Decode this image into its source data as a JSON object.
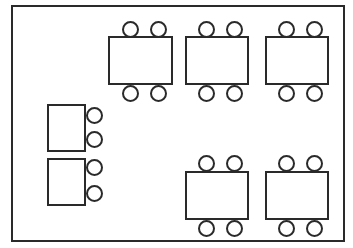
{
  "diagram": {
    "type": "floor-plan",
    "colors": {
      "stroke": "#2a2a2a",
      "fill": "#ffffff"
    },
    "room": {
      "x": 11,
      "y": 5,
      "w": 334,
      "h": 237
    },
    "tables": [
      {
        "id": "table-1",
        "x": 108,
        "y": 36,
        "w": 65,
        "h": 49,
        "chairs": [
          [
            130,
            29
          ],
          [
            158,
            29
          ],
          [
            130,
            93
          ],
          [
            158,
            93
          ]
        ]
      },
      {
        "id": "table-2",
        "x": 185,
        "y": 36,
        "w": 64,
        "h": 49,
        "chairs": [
          [
            206,
            29
          ],
          [
            234,
            29
          ],
          [
            206,
            93
          ],
          [
            234,
            93
          ]
        ]
      },
      {
        "id": "table-3",
        "x": 265,
        "y": 36,
        "w": 64,
        "h": 49,
        "chairs": [
          [
            286,
            29
          ],
          [
            314,
            29
          ],
          [
            286,
            93
          ],
          [
            314,
            93
          ]
        ]
      },
      {
        "id": "table-4",
        "x": 47,
        "y": 104,
        "w": 39,
        "h": 48,
        "chairs": [
          [
            94,
            115
          ],
          [
            94,
            139
          ]
        ]
      },
      {
        "id": "table-5",
        "x": 47,
        "y": 158,
        "w": 39,
        "h": 48,
        "chairs": [
          [
            94,
            167
          ],
          [
            94,
            193
          ]
        ]
      },
      {
        "id": "table-6",
        "x": 185,
        "y": 171,
        "w": 64,
        "h": 49,
        "chairs": [
          [
            206,
            163
          ],
          [
            234,
            163
          ],
          [
            206,
            228
          ],
          [
            234,
            228
          ]
        ]
      },
      {
        "id": "table-7",
        "x": 265,
        "y": 171,
        "w": 64,
        "h": 49,
        "chairs": [
          [
            286,
            163
          ],
          [
            314,
            163
          ],
          [
            286,
            228
          ],
          [
            314,
            228
          ]
        ]
      }
    ]
  }
}
